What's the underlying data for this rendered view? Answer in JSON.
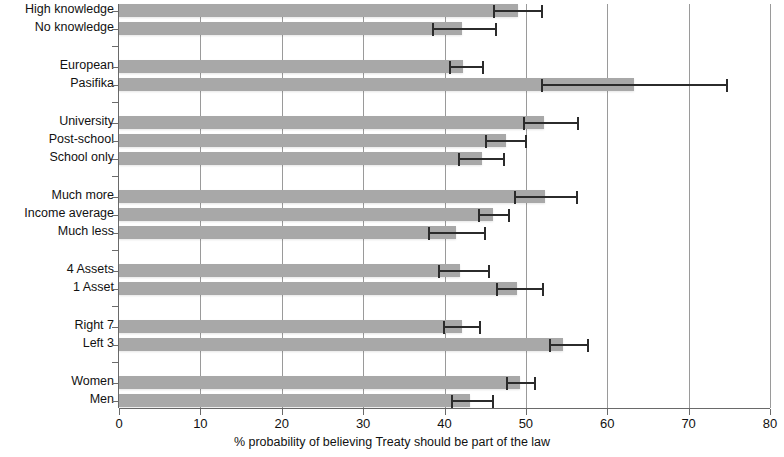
{
  "chart_data": {
    "type": "bar",
    "orientation": "horizontal",
    "title": "",
    "xlabel": "% probability of believing Treaty should be part of the law",
    "ylabel": "",
    "xlim": [
      0,
      80
    ],
    "xticks": [
      0,
      10,
      20,
      30,
      40,
      50,
      60,
      70,
      80
    ],
    "xticklabels": [
      "0",
      "10",
      "20",
      "30",
      "40",
      "50",
      "60",
      "70",
      "80"
    ],
    "grid": true,
    "grid_axis": "x",
    "legend": null,
    "error_bars": "95% confidence interval",
    "bar_color": "#a8a8a8",
    "error_color": "#2b2b2b",
    "groups": [
      {
        "name": "Treaty knowledge",
        "categories": [
          "High knowledge",
          "No knowledge"
        ],
        "values": [
          49.0,
          42.2
        ],
        "err_low": [
          46.0,
          38.5
        ],
        "err_high": [
          52.1,
          46.5
        ]
      },
      {
        "name": "Ethnicity",
        "categories": [
          "European",
          "Pasifika"
        ],
        "values": [
          42.3,
          63.3
        ],
        "err_low": [
          40.6,
          51.8
        ],
        "err_high": [
          44.8,
          74.9
        ]
      },
      {
        "name": "Education",
        "categories": [
          "University",
          "Post-school",
          "School only"
        ],
        "values": [
          52.2,
          47.6,
          44.6
        ],
        "err_low": [
          49.7,
          45.0,
          41.7
        ],
        "err_high": [
          56.5,
          50.1,
          47.4
        ]
      },
      {
        "name": "Income",
        "categories": [
          "Much more",
          "Income average",
          "Much less"
        ],
        "values": [
          52.3,
          45.9,
          41.4
        ],
        "err_low": [
          48.6,
          44.1,
          38.0
        ],
        "err_high": [
          56.4,
          48.0,
          45.1
        ]
      },
      {
        "name": "Assets",
        "categories": [
          "4 Assets",
          "1 Asset"
        ],
        "values": [
          41.9,
          48.9
        ],
        "err_low": [
          39.2,
          46.3
        ],
        "err_high": [
          45.6,
          52.2
        ]
      },
      {
        "name": "Political orientation",
        "categories": [
          "Right 7",
          "Left 3"
        ],
        "values": [
          42.1,
          54.6
        ],
        "err_low": [
          39.8,
          52.8
        ],
        "err_high": [
          44.5,
          57.7
        ]
      },
      {
        "name": "Gender",
        "categories": [
          "Women",
          "Men"
        ],
        "values": [
          49.3,
          43.1
        ],
        "err_low": [
          47.6,
          40.8
        ],
        "err_high": [
          51.3,
          46.1
        ]
      }
    ]
  }
}
